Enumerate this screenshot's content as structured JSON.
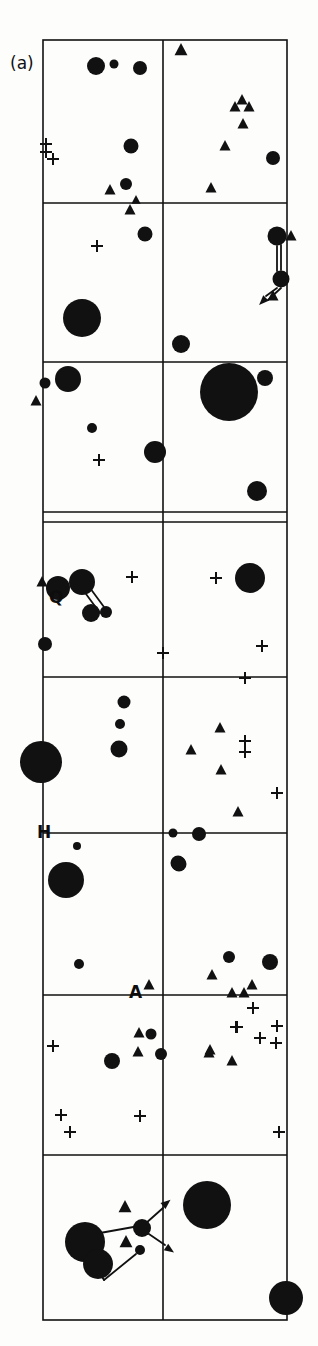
{
  "figure": {
    "panel_label": "(a)",
    "width": 318,
    "height": 1346,
    "background_color": "#fdfdfc",
    "ink_color": "#111111",
    "frame": {
      "left": 43,
      "right": 287,
      "top": 40,
      "bottom": 1320,
      "stroke_width": 1.6
    },
    "vertical_divider_x": 163,
    "horizontal_gridlines": [
      203,
      362,
      512,
      522,
      677,
      833,
      995,
      1155
    ],
    "marker_legend": [
      {
        "symbol": "filled-circle",
        "name": "circle-marker"
      },
      {
        "symbol": "filled-triangle",
        "name": "triangle-marker"
      },
      {
        "symbol": "plus",
        "name": "plus-marker"
      }
    ],
    "axis_labels": [
      {
        "id": "label-q",
        "text": "Q",
        "x": 49,
        "y": 587
      },
      {
        "id": "label-h",
        "text": "H",
        "x": 37,
        "y": 822
      },
      {
        "id": "label-a-horizon",
        "text": "A",
        "x": 129,
        "y": 982
      }
    ]
  },
  "chart_data": {
    "type": "scatter",
    "title": "(a)",
    "xlabel": "",
    "ylabel": "",
    "xlim": [
      43,
      287
    ],
    "ylim": [
      1320,
      40
    ],
    "grid": true,
    "legend": "none",
    "series": [
      {
        "name": "circles",
        "marker": "filled-circle",
        "points": [
          {
            "x": 96,
            "y": 66,
            "r": 9
          },
          {
            "x": 114,
            "y": 64,
            "r": 4.5
          },
          {
            "x": 140,
            "y": 68,
            "r": 7
          },
          {
            "x": 131,
            "y": 146,
            "r": 7.5
          },
          {
            "x": 273,
            "y": 158,
            "r": 7
          },
          {
            "x": 126,
            "y": 184,
            "r": 6
          },
          {
            "x": 145,
            "y": 234,
            "r": 7.5
          },
          {
            "x": 277,
            "y": 236,
            "r": 9.5
          },
          {
            "x": 281,
            "y": 279,
            "r": 8.5
          },
          {
            "x": 82,
            "y": 318,
            "r": 19
          },
          {
            "x": 181,
            "y": 344,
            "r": 9
          },
          {
            "x": 68,
            "y": 379,
            "r": 13
          },
          {
            "x": 45,
            "y": 383,
            "r": 5.5
          },
          {
            "x": 92,
            "y": 428,
            "r": 5
          },
          {
            "x": 155,
            "y": 452,
            "r": 11
          },
          {
            "x": 229,
            "y": 392,
            "r": 29
          },
          {
            "x": 265,
            "y": 378,
            "r": 8
          },
          {
            "x": 257,
            "y": 491,
            "r": 10
          },
          {
            "x": 82,
            "y": 582,
            "r": 13
          },
          {
            "x": 58,
            "y": 588,
            "r": 12
          },
          {
            "x": 91,
            "y": 613,
            "r": 9
          },
          {
            "x": 106,
            "y": 612,
            "r": 6
          },
          {
            "x": 45,
            "y": 644,
            "r": 7
          },
          {
            "x": 250,
            "y": 578,
            "r": 15
          },
          {
            "x": 124,
            "y": 702,
            "r": 6.5
          },
          {
            "x": 120,
            "y": 724,
            "r": 5
          },
          {
            "x": 119,
            "y": 749,
            "r": 8.5
          },
          {
            "x": 41,
            "y": 762,
            "r": 21
          },
          {
            "x": 77,
            "y": 846,
            "r": 4
          },
          {
            "x": 66,
            "y": 880,
            "r": 18
          },
          {
            "x": 173,
            "y": 833,
            "r": 4.5
          },
          {
            "x": 199,
            "y": 834,
            "r": 7
          },
          {
            "x": 178,
            "y": 863,
            "r": 7.5
          },
          {
            "x": 179,
            "y": 864,
            "r": 7.5
          },
          {
            "x": 79,
            "y": 964,
            "r": 5
          },
          {
            "x": 270,
            "y": 962,
            "r": 8
          },
          {
            "x": 229,
            "y": 957,
            "r": 6
          },
          {
            "x": 151,
            "y": 1034,
            "r": 5.5
          },
          {
            "x": 112,
            "y": 1061,
            "r": 8
          },
          {
            "x": 161,
            "y": 1054,
            "r": 6
          },
          {
            "x": 85,
            "y": 1242,
            "r": 20
          },
          {
            "x": 98,
            "y": 1264,
            "r": 15
          },
          {
            "x": 140,
            "y": 1250,
            "r": 5
          },
          {
            "x": 142,
            "y": 1228,
            "r": 9
          },
          {
            "x": 207,
            "y": 1205,
            "r": 24
          },
          {
            "x": 286,
            "y": 1298,
            "r": 17
          }
        ]
      },
      {
        "name": "triangles",
        "marker": "filled-triangle",
        "points": [
          {
            "x": 181,
            "y": 50,
            "s": 7
          },
          {
            "x": 242,
            "y": 100,
            "s": 6
          },
          {
            "x": 235,
            "y": 107,
            "s": 6
          },
          {
            "x": 249,
            "y": 107,
            "s": 6
          },
          {
            "x": 243,
            "y": 124,
            "s": 6
          },
          {
            "x": 225,
            "y": 146,
            "s": 6
          },
          {
            "x": 211,
            "y": 188,
            "s": 6
          },
          {
            "x": 110,
            "y": 190,
            "s": 6
          },
          {
            "x": 136,
            "y": 200,
            "s": 5
          },
          {
            "x": 130,
            "y": 210,
            "s": 6
          },
          {
            "x": 291,
            "y": 236,
            "s": 6
          },
          {
            "x": 273,
            "y": 296,
            "s": 6
          },
          {
            "x": 36,
            "y": 401,
            "s": 6
          },
          {
            "x": 42,
            "y": 582,
            "s": 6
          },
          {
            "x": 220,
            "y": 728,
            "s": 6
          },
          {
            "x": 191,
            "y": 750,
            "s": 6
          },
          {
            "x": 221,
            "y": 770,
            "s": 6
          },
          {
            "x": 238,
            "y": 812,
            "s": 6
          },
          {
            "x": 212,
            "y": 975,
            "s": 6
          },
          {
            "x": 149,
            "y": 985,
            "s": 6
          },
          {
            "x": 252,
            "y": 985,
            "s": 6
          },
          {
            "x": 232,
            "y": 993,
            "s": 6
          },
          {
            "x": 244,
            "y": 993,
            "s": 6
          },
          {
            "x": 139,
            "y": 1033,
            "s": 6
          },
          {
            "x": 209,
            "y": 1053,
            "s": 6
          },
          {
            "x": 232,
            "y": 1061,
            "s": 6
          },
          {
            "x": 138,
            "y": 1052,
            "s": 6
          },
          {
            "x": 210,
            "y": 1050,
            "s": 6
          },
          {
            "x": 125,
            "y": 1207,
            "s": 7
          },
          {
            "x": 126,
            "y": 1242,
            "s": 7
          }
        ]
      },
      {
        "name": "plus-signs",
        "marker": "plus",
        "points": [
          {
            "x": 46,
            "y": 144,
            "s": 6
          },
          {
            "x": 46,
            "y": 152,
            "s": 6
          },
          {
            "x": 53,
            "y": 159,
            "s": 6
          },
          {
            "x": 97,
            "y": 246,
            "s": 6
          },
          {
            "x": 99,
            "y": 460,
            "s": 6
          },
          {
            "x": 132,
            "y": 577,
            "s": 6
          },
          {
            "x": 216,
            "y": 578,
            "s": 6
          },
          {
            "x": 163,
            "y": 653,
            "s": 6
          },
          {
            "x": 262,
            "y": 646,
            "s": 6
          },
          {
            "x": 245,
            "y": 678,
            "s": 6
          },
          {
            "x": 245,
            "y": 741,
            "s": 6
          },
          {
            "x": 245,
            "y": 752,
            "s": 6
          },
          {
            "x": 277,
            "y": 793,
            "s": 6
          },
          {
            "x": 253,
            "y": 1008,
            "s": 6
          },
          {
            "x": 236,
            "y": 1027,
            "s": 6
          },
          {
            "x": 260,
            "y": 1038,
            "s": 6
          },
          {
            "x": 53,
            "y": 1046,
            "s": 6
          },
          {
            "x": 277,
            "y": 1026,
            "s": 6
          },
          {
            "x": 237,
            "y": 1027,
            "s": 6
          },
          {
            "x": 61,
            "y": 1115,
            "s": 6
          },
          {
            "x": 70,
            "y": 1132,
            "s": 6
          },
          {
            "x": 140,
            "y": 1116,
            "s": 6
          },
          {
            "x": 279,
            "y": 1132,
            "s": 6
          },
          {
            "x": 276,
            "y": 1043,
            "s": 6
          }
        ]
      }
    ],
    "connector_lines": [
      {
        "x1": 281,
        "y1": 245,
        "x2": 281,
        "y2": 270
      },
      {
        "x1": 277,
        "y1": 246,
        "x2": 277,
        "y2": 271
      },
      {
        "x1": 281,
        "y1": 288,
        "x2": 268,
        "y2": 300
      },
      {
        "x1": 277,
        "y1": 288,
        "x2": 266,
        "y2": 296
      },
      {
        "x1": 90,
        "y1": 588,
        "x2": 104,
        "y2": 607
      },
      {
        "x1": 86,
        "y1": 594,
        "x2": 100,
        "y2": 613
      },
      {
        "x1": 100,
        "y1": 1233,
        "x2": 139,
        "y2": 1226
      },
      {
        "x1": 145,
        "y1": 1224,
        "x2": 163,
        "y2": 1208
      },
      {
        "x1": 146,
        "y1": 1232,
        "x2": 165,
        "y2": 1245
      },
      {
        "x1": 88,
        "y1": 1254,
        "x2": 104,
        "y2": 1280
      },
      {
        "x1": 104,
        "y1": 1280,
        "x2": 136,
        "y2": 1254
      }
    ],
    "arrowheads": [
      {
        "x": 163,
        "y": 1206,
        "angle": -40
      },
      {
        "x": 166,
        "y": 1247,
        "angle": 35
      },
      {
        "x": 266,
        "y": 298,
        "angle": 135
      }
    ]
  }
}
